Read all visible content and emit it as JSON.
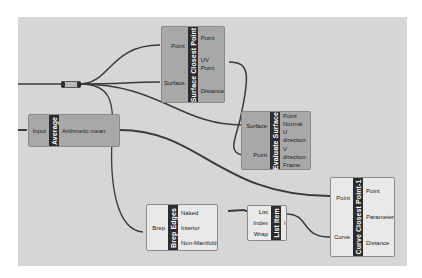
{
  "canvas": {
    "background": "#d6d6d6",
    "selected_fill": "#a8a8a8",
    "normal_fill": "#e9e9e9"
  },
  "components": {
    "surface_closest_point": {
      "title": "Surface Closest Point",
      "inputs": [
        "Point",
        "Surface"
      ],
      "outputs": [
        "Point",
        "UV Point",
        "Distance"
      ]
    },
    "average": {
      "title": "Average",
      "inputs": [
        "Input"
      ],
      "outputs": [
        "Arithmetic mean"
      ]
    },
    "evaluate_surface": {
      "title": "Evaluate Surface",
      "inputs": [
        "Surface",
        "Point"
      ],
      "outputs": [
        "Point",
        "Normal",
        "U direction",
        "V direction",
        "Frame"
      ]
    },
    "brep_edges": {
      "title": "Brep Edges",
      "inputs": [
        "Brep"
      ],
      "outputs": [
        "Naked",
        "Interior",
        "Non-Manifold"
      ]
    },
    "list_item": {
      "title": "List Item",
      "inputs": [
        "List",
        "Index",
        "Wrap"
      ],
      "outputs": [
        "i"
      ]
    },
    "curve_closest_point": {
      "title": "Curve Closest Point-1",
      "inputs": [
        "Point",
        "Curve"
      ],
      "outputs": [
        "Point",
        "Parameter",
        "Distance"
      ]
    }
  },
  "relay": {
    "name": "relay"
  }
}
